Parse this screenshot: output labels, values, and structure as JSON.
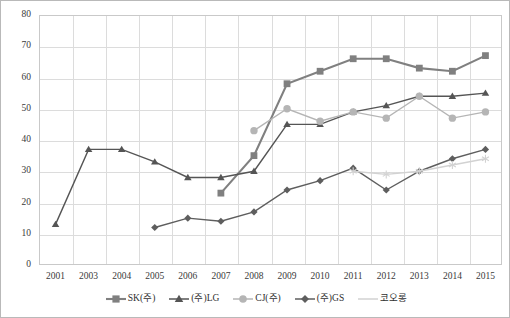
{
  "chart_data": {
    "type": "line",
    "title": "",
    "xlabel": "",
    "ylabel": "",
    "categories": [
      "2001",
      "2003",
      "2004",
      "2005",
      "2006",
      "2007",
      "2008",
      "2009",
      "2010",
      "2011",
      "2012",
      "2013",
      "2014",
      "2015"
    ],
    "ylim": [
      0,
      80
    ],
    "yticks": [
      "0",
      "10",
      "20",
      "30",
      "40",
      "50",
      "60",
      "70",
      "80"
    ],
    "grid": true,
    "legend_position": "bottom",
    "series": [
      {
        "name": "SK(주)",
        "marker": "square",
        "color": "#808080",
        "values": [
          null,
          null,
          null,
          null,
          null,
          23,
          35,
          58,
          62,
          66,
          66,
          63,
          62,
          67
        ]
      },
      {
        "name": "(주)LG",
        "marker": "triangle",
        "color": "#555555",
        "values": [
          13,
          37,
          37,
          33,
          28,
          28,
          30,
          45,
          45,
          49,
          51,
          54,
          54,
          55
        ]
      },
      {
        "name": "CJ(주)",
        "marker": "circle",
        "color": "#b5b5b5",
        "values": [
          null,
          null,
          null,
          null,
          null,
          null,
          43,
          50,
          46,
          49,
          47,
          54,
          47,
          49
        ]
      },
      {
        "name": "(주)GS",
        "marker": "diamond",
        "color": "#5e5e5e",
        "values": [
          null,
          null,
          null,
          12,
          15,
          14,
          17,
          24,
          27,
          31,
          24,
          30,
          34,
          37
        ]
      },
      {
        "name": "코오롱",
        "marker": "asterisk",
        "color": "#d2d2d2",
        "values": [
          null,
          null,
          null,
          null,
          null,
          null,
          null,
          null,
          null,
          30,
          29,
          30,
          32,
          34
        ]
      }
    ]
  }
}
